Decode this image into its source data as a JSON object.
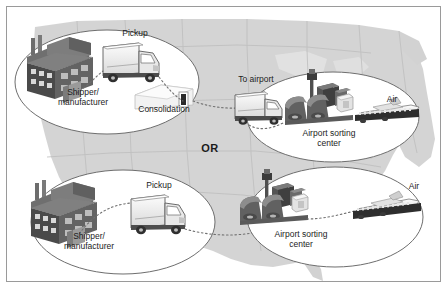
{
  "figure": {
    "background_map": "united-states-outline",
    "frame_color": "#9a9a9a",
    "map_fill": "#d2d2d2",
    "map_line": "#bcbcbc",
    "ellipse_fill": "#ffffff",
    "ellipse_stroke": "#6e6e6e",
    "route_stroke": "#707070",
    "text_color": "#1c1c1c"
  },
  "connector_label": {
    "text": "OR",
    "x": 203,
    "y": 141
  },
  "stages": [
    {
      "id": "origin-consolidation",
      "ellipse": {
        "cx": 100,
        "cy": 75,
        "rx": 92,
        "ry": 52
      },
      "labels": [
        {
          "name": "pickup-label",
          "text": "Pickup",
          "x": 128,
          "y": 27,
          "align": "center"
        },
        {
          "name": "shipper-label-line1",
          "text": "Shipper/",
          "x": 76,
          "y": 86,
          "align": "center"
        },
        {
          "name": "shipper-label-line2",
          "text": "manufacturer",
          "x": 76,
          "y": 96,
          "align": "center"
        },
        {
          "name": "consolidation-label",
          "text": "Consolidation",
          "x": 157,
          "y": 103,
          "align": "center"
        }
      ],
      "icons": [
        "factory-icon",
        "pickup-truck-icon",
        "warehouse-icon"
      ]
    },
    {
      "id": "airport-sorting-top",
      "ellipse": {
        "cx": 326,
        "cy": 110,
        "rx": 86,
        "ry": 45
      },
      "labels": [
        {
          "name": "to-airport-label",
          "text": "To airport",
          "x": 249,
          "y": 73,
          "align": "center"
        },
        {
          "name": "air-label-top",
          "text": "Air",
          "x": 385,
          "y": 93,
          "align": "center"
        },
        {
          "name": "airport-sorting-label-top-line1",
          "text": "Airport sorting",
          "x": 322,
          "y": 126,
          "align": "center"
        },
        {
          "name": "airport-sorting-label-top-line2",
          "text": "center",
          "x": 322,
          "y": 136,
          "align": "center"
        }
      ],
      "icons": [
        "line-haul-truck-icon",
        "sorting-facility-icon",
        "cargo-plane-icon"
      ]
    },
    {
      "id": "origin-direct",
      "ellipse": {
        "cx": 116,
        "cy": 215,
        "rx": 92,
        "ry": 52
      },
      "labels": [
        {
          "name": "pickup-label-bottom",
          "text": "Pickup",
          "x": 152,
          "y": 178,
          "align": "center"
        },
        {
          "name": "shipper-label-bottom-line1",
          "text": "Shipper/",
          "x": 82,
          "y": 229,
          "align": "center"
        },
        {
          "name": "shipper-label-bottom-line2",
          "text": "manufacturer",
          "x": 82,
          "y": 239,
          "align": "center"
        }
      ],
      "icons": [
        "factory-icon",
        "pickup-truck-icon"
      ]
    },
    {
      "id": "airport-sorting-bottom",
      "ellipse": {
        "cx": 328,
        "cy": 210,
        "rx": 88,
        "ry": 50
      },
      "labels": [
        {
          "name": "air-label-bottom",
          "text": "Air",
          "x": 407,
          "y": 180,
          "align": "center"
        },
        {
          "name": "airport-sorting-label-bottom-line1",
          "text": "Airport sorting",
          "x": 294,
          "y": 227,
          "align": "center"
        },
        {
          "name": "airport-sorting-label-bottom-line2",
          "text": "center",
          "x": 294,
          "y": 237,
          "align": "center"
        }
      ],
      "icons": [
        "sorting-facility-icon",
        "cargo-plane-icon"
      ]
    }
  ]
}
